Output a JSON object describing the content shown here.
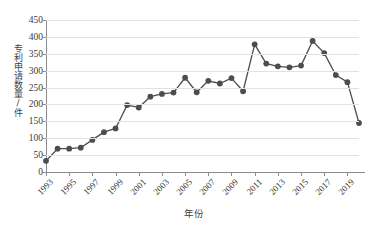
{
  "chart_data": {
    "type": "line",
    "title": "",
    "xlabel": "年份",
    "ylabel": "专利申请数量/件",
    "ylim": [
      0,
      450
    ],
    "ytick_step": 50,
    "yticks": [
      0,
      50,
      100,
      150,
      200,
      250,
      300,
      350,
      400,
      450
    ],
    "xlim": [
      1993,
      2020
    ],
    "xticks": [
      1993,
      1995,
      1997,
      1999,
      2001,
      2003,
      2005,
      2007,
      2009,
      2011,
      2013,
      2015,
      2017,
      2019
    ],
    "xtick_labels": [
      "1993",
      "1995",
      "1997",
      "1999",
      "2001",
      "2003",
      "2005",
      "2007",
      "2009",
      "2011",
      "2013",
      "2015",
      "2017",
      "2019"
    ],
    "grid": "horizontal",
    "legend": "none",
    "marker": "circle",
    "series_color": "#4d4d4d",
    "grid_color": "#e2e2e2",
    "axis_color": "#8c8c8c",
    "x": [
      1993,
      1994,
      1995,
      1996,
      1997,
      1998,
      1999,
      2000,
      2001,
      2002,
      2003,
      2004,
      2005,
      2006,
      2007,
      2008,
      2009,
      2010,
      2011,
      2012,
      2013,
      2014,
      2015,
      2016,
      2017,
      2018,
      2019,
      2020
    ],
    "categories": [
      "1993",
      "1994",
      "1995",
      "1996",
      "1997",
      "1998",
      "1999",
      "2000",
      "2001",
      "2002",
      "2003",
      "2004",
      "2005",
      "2006",
      "2007",
      "2008",
      "2009",
      "2010",
      "2011",
      "2012",
      "2013",
      "2014",
      "2015",
      "2016",
      "2017",
      "2018",
      "2019",
      "2020"
    ],
    "values": [
      33,
      69,
      69,
      72,
      95,
      118,
      129,
      198,
      191,
      223,
      231,
      235,
      279,
      236,
      270,
      262,
      278,
      239,
      378,
      321,
      313,
      310,
      315,
      388,
      352,
      287,
      266,
      145
    ],
    "series": [
      {
        "name": "专利申请数量",
        "values": [
          33,
          69,
          69,
          72,
          95,
          118,
          129,
          198,
          191,
          223,
          231,
          235,
          279,
          236,
          270,
          262,
          278,
          239,
          378,
          321,
          313,
          310,
          315,
          388,
          352,
          287,
          266,
          145
        ]
      }
    ]
  }
}
